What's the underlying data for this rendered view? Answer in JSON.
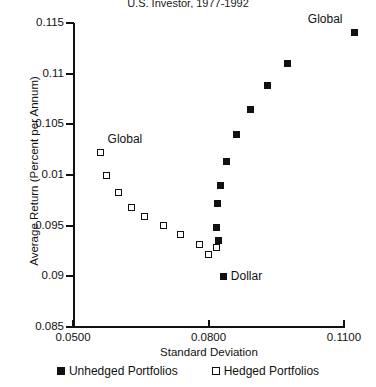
{
  "chart_data": {
    "type": "scatter",
    "title": "U.S. Investor, 1977-1992",
    "xlabel": "Standard Deviation",
    "ylabel": "Average Return (Percent per Annum)",
    "xlim": [
      0.05,
      0.11
    ],
    "ylim": [
      0.085,
      0.115
    ],
    "grid": false,
    "xticks": [
      "0.0500",
      "0.0800",
      "0.1100"
    ],
    "xtick_values": [
      0.05,
      0.08,
      0.11
    ],
    "yticks": [
      "0.115",
      "0.11",
      "0.105",
      "0.01",
      "0.095",
      "0.09",
      "0.085"
    ],
    "ytick_values": [
      0.115,
      0.11,
      0.105,
      0.1,
      0.095,
      0.09,
      0.085
    ],
    "legend_position": "bottom",
    "series": [
      {
        "name": "Unhedged Portfolios",
        "marker": "filled-square",
        "color": "#111111",
        "points": [
          {
            "x": 0.0834,
            "y": 0.09
          },
          {
            "x": 0.0823,
            "y": 0.0935
          },
          {
            "x": 0.0817,
            "y": 0.0948
          },
          {
            "x": 0.0821,
            "y": 0.0972
          },
          {
            "x": 0.0827,
            "y": 0.099
          },
          {
            "x": 0.084,
            "y": 0.1013
          },
          {
            "x": 0.0862,
            "y": 0.104
          },
          {
            "x": 0.0893,
            "y": 0.1065
          },
          {
            "x": 0.0931,
            "y": 0.1088
          },
          {
            "x": 0.0975,
            "y": 0.111
          },
          {
            "x": 0.1124,
            "y": 0.1141
          }
        ]
      },
      {
        "name": "Hedged Portfolios",
        "marker": "open-square",
        "color": "#111111",
        "points": [
          {
            "x": 0.0561,
            "y": 0.1022
          },
          {
            "x": 0.0574,
            "y": 0.1
          },
          {
            "x": 0.06,
            "y": 0.0983
          },
          {
            "x": 0.0629,
            "y": 0.0968
          },
          {
            "x": 0.0659,
            "y": 0.0959
          },
          {
            "x": 0.07,
            "y": 0.095
          },
          {
            "x": 0.0737,
            "y": 0.0941
          },
          {
            "x": 0.0781,
            "y": 0.0931
          },
          {
            "x": 0.08,
            "y": 0.0922
          },
          {
            "x": 0.0818,
            "y": 0.0928
          }
        ]
      }
    ],
    "annotations": [
      {
        "text": "Global",
        "x": 0.1124,
        "y": 0.1141,
        "series": "Unhedged Portfolios",
        "placement": "above-left"
      },
      {
        "text": "Global",
        "x": 0.0561,
        "y": 0.1036,
        "series": "Hedged Portfolios",
        "placement": "right"
      },
      {
        "text": "Dollar",
        "x": 0.0834,
        "y": 0.09,
        "series": "Unhedged Portfolios",
        "placement": "right"
      }
    ]
  },
  "legend": {
    "items": [
      {
        "label": "Unhedged Portfolios",
        "marker": "filled-square"
      },
      {
        "label": "Hedged Portfolios",
        "marker": "open-square"
      }
    ]
  }
}
